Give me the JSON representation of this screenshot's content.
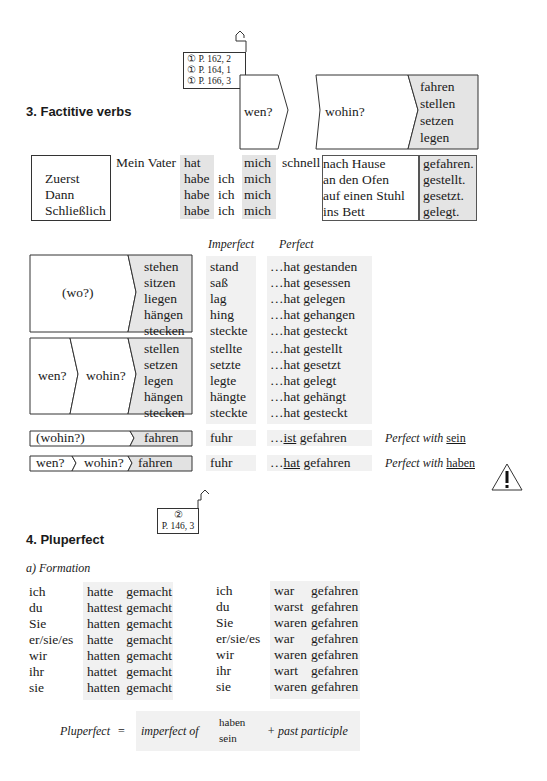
{
  "section3": {
    "title": "3.  Factitive verbs",
    "refs": [
      "① P. 162, 2",
      "① P. 164, 1",
      "① P. 166, 3"
    ]
  },
  "diagram": {
    "wen": "wen?",
    "wohin": "wohin?",
    "verbs": [
      "fahren",
      "stellen",
      "setzen",
      "legen"
    ]
  },
  "sentences": {
    "subject": "Mein Vater",
    "adverbs": [
      "",
      "Zuerst",
      "Dann",
      "Schließlich"
    ],
    "aux": [
      "hat",
      "habe",
      "habe",
      "habe"
    ],
    "ich": [
      "",
      "ich",
      "ich",
      "ich"
    ],
    "obj": [
      "mich",
      "mich",
      "mich",
      "mich"
    ],
    "schnell": "schnell",
    "place": [
      "nach Hause",
      "an den Ofen",
      "auf einen Stuhl",
      "ins Bett"
    ],
    "participle": [
      "gefahren.",
      "gestellt.",
      "gesetzt.",
      "gelegt."
    ]
  },
  "headers": {
    "imperfect": "Imperfect",
    "perfect": "Perfect"
  },
  "wo_group": {
    "label": "(wo?)",
    "verbs": [
      "stehen",
      "sitzen",
      "liegen",
      "hängen",
      "stecken"
    ],
    "imperfect": [
      "stand",
      "saß",
      "lag",
      "hing",
      "steckte"
    ],
    "perfect": [
      "…hat gestanden",
      "…hat gesessen",
      "…hat gelegen",
      "…hat gehangen",
      "…hat gesteckt"
    ]
  },
  "wohin_group": {
    "wen": "wen?",
    "wohin": "wohin?",
    "verbs": [
      "stellen",
      "setzen",
      "legen",
      "hängen",
      "stecken"
    ],
    "imperfect": [
      "stellte",
      "setzte",
      "legte",
      "hängte",
      "steckte"
    ],
    "perfect": [
      "…hat gestellt",
      "…hat gesetzt",
      "…hat gelegt",
      "…hat gehängt",
      "…hat gesteckt"
    ]
  },
  "fahren_rows": [
    {
      "q": "(wohin?)",
      "verb": "fahren",
      "imp": "fuhr",
      "pre": "…",
      "aux": "ist",
      "part": " gefahren",
      "note": "Perfect with ",
      "note_aux": "sein"
    },
    {
      "q1": "wen?",
      "q2": "wohin?",
      "verb": "fahren",
      "imp": "fuhr",
      "pre": "…",
      "aux": "hat",
      "part": " gefahren",
      "note": "Perfect with ",
      "note_aux": "haben"
    }
  ],
  "section4": {
    "title": "4.  Pluperfect",
    "ref_num": "②",
    "ref": "P. 146, 3",
    "sub": "a)  Formation"
  },
  "pluperfect": {
    "pronouns": [
      "ich",
      "du",
      "Sie",
      "er/sie/es",
      "wir",
      "ihr",
      "sie"
    ],
    "haben": [
      "hatte",
      "hattest",
      "hatten",
      "hatte",
      "hatten",
      "hattet",
      "hatten"
    ],
    "haben_part": "gemacht",
    "sein": [
      "war",
      "warst",
      "waren",
      "war",
      "waren",
      "wart",
      "waren"
    ],
    "sein_part": "gefahren"
  },
  "formula": {
    "lhs": "Pluperfect",
    "eq": "=",
    "imp": "imperfect of",
    "aux1": "haben",
    "aux2": "sein",
    "rhs": "+  past participle"
  }
}
